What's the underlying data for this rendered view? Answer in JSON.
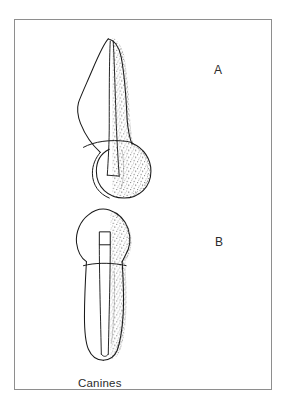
{
  "figure": {
    "caption": "Canines",
    "background_color": "#ffffff",
    "frame_color": "#8e8e8e",
    "ink_color": "#1a1a1a",
    "stipple_color": "#3a3a3a",
    "labels": [
      {
        "key": "a",
        "text": "A"
      },
      {
        "key": "b",
        "text": "B"
      }
    ],
    "specimens": [
      {
        "key": "a",
        "label": "A",
        "name": "maxillary-canine-labial-view",
        "orientation": "root-up-crown-down",
        "parts": [
          "root",
          "cervical-line",
          "crown",
          "pulp-canal",
          "pulp-chamber",
          "stippled-shading"
        ],
        "shading_side": "right"
      },
      {
        "key": "b",
        "label": "B",
        "name": "mandibular-canine-proximal-view",
        "orientation": "crown-up-root-down",
        "parts": [
          "crown",
          "cervical-line",
          "root",
          "pulp-chamber",
          "pulp-canal",
          "stippled-shading"
        ],
        "shading_side": "right"
      }
    ]
  }
}
